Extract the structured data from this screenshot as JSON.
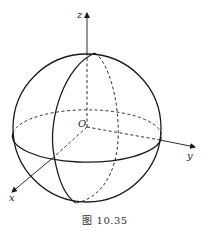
{
  "figure": {
    "caption": "图 10.35",
    "axes": {
      "x_label": "x",
      "y_label": "y",
      "z_label": "z",
      "origin_label": "O"
    },
    "elements": [
      "sphere-outline",
      "equator-circle",
      "meridian-circle",
      "x-axis",
      "y-axis",
      "z-axis"
    ],
    "style": {
      "stroke_color": "#1a1a1a",
      "background": "#ffffff"
    }
  }
}
